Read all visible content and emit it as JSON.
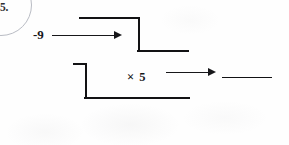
{
  "worksheet": {
    "question_number": "5.",
    "background_color": "#fefefe",
    "ink_color": "#121214"
  },
  "machine": {
    "input_label": "-9",
    "operation_label": "× 5",
    "answer_blank_value": ""
  },
  "icons": {
    "arrow_one": "right-arrow-icon",
    "arrow_two": "right-arrow-icon"
  }
}
